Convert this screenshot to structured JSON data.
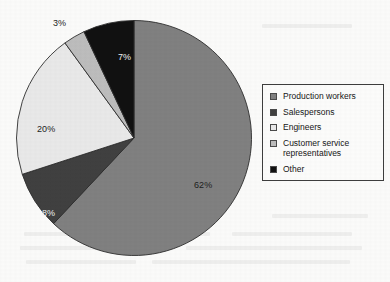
{
  "chart_data": {
    "type": "pie",
    "title": "",
    "subtitle": "",
    "xlabel": "",
    "ylabel": "",
    "legend_position": "right",
    "grid": false,
    "units": "percent",
    "categories": [
      "Production workers",
      "Salespersons",
      "Engineers",
      "Customer service representatives",
      "Other"
    ],
    "values": [
      62,
      8,
      20,
      3,
      7
    ],
    "data_labels": [
      "62%",
      "8%",
      "20%",
      "3%",
      "7%"
    ],
    "colors": [
      "#808080",
      "#404040",
      "#e9e9e9",
      "#bdbdbd",
      "#111111"
    ],
    "slices": [
      {
        "label": "Production workers",
        "value": 62,
        "data_label": "62%",
        "color": "#808080",
        "label_placement": "inside",
        "label_color": "dark"
      },
      {
        "label": "Salespersons",
        "value": 8,
        "data_label": "8%",
        "color": "#404040",
        "label_placement": "inside",
        "label_color": "light"
      },
      {
        "label": "Engineers",
        "value": 20,
        "data_label": "20%",
        "color": "#e9e9e9",
        "label_placement": "inside",
        "label_color": "dark"
      },
      {
        "label": "Customer service representatives",
        "value": 3,
        "data_label": "3%",
        "color": "#bdbdbd",
        "label_placement": "outside",
        "label_color": "dark"
      },
      {
        "label": "Other",
        "value": 7,
        "data_label": "7%",
        "color": "#111111",
        "label_placement": "inside",
        "label_color": "light"
      }
    ]
  },
  "legend": {
    "border_color": "#3d3d3d",
    "items": [
      {
        "label": "Production workers",
        "color": "#808080"
      },
      {
        "label": "Salespersons",
        "color": "#404040"
      },
      {
        "label": "Engineers",
        "color": "#e9e9e9"
      },
      {
        "label": "Customer service representatives",
        "color": "#bdbdbd"
      },
      {
        "label": "Other",
        "color": "#111111"
      }
    ]
  }
}
